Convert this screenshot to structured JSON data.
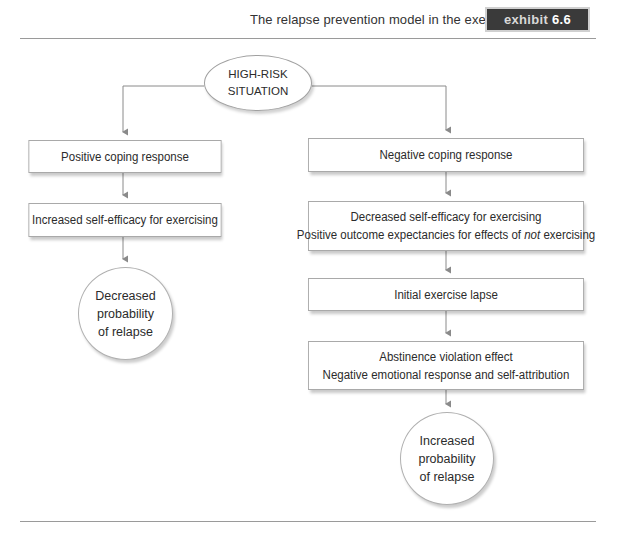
{
  "header": {
    "caption": "The relapse prevention model in the exercise domain.",
    "badge_label": "exhibit",
    "badge_number": "6.6"
  },
  "diagram": {
    "root": {
      "line1": "HIGH-RISK",
      "line2": "SITUATION"
    },
    "left_branch": {
      "step1": "Positive coping response",
      "step2": "Increased self-efficacy for exercising",
      "outcome": {
        "line1": "Decreased",
        "line2": "probability",
        "line3": "of relapse"
      }
    },
    "right_branch": {
      "step1": "Negative coping response",
      "step2": {
        "line1": "Decreased self-efficacy for exercising",
        "line2_before": "Positive outcome expectancies for effects of ",
        "line2_emph": "not",
        "line2_after": " exercising"
      },
      "step3": "Initial exercise lapse",
      "step4": {
        "line1": "Abstinence violation effect",
        "line2": "Negative emotional response and self-attribution"
      },
      "outcome": {
        "line1": "Increased",
        "line2": "probability",
        "line3": "of relapse"
      }
    },
    "colors": {
      "line": "#8a8a8a",
      "box_border": "#a9a9a9",
      "badge_bg": "#3a3a3a"
    }
  }
}
